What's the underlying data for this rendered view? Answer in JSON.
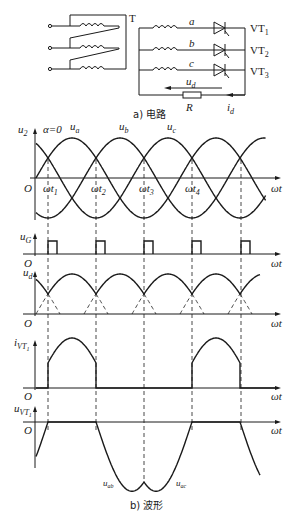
{
  "circuit": {
    "transformer_label": "T",
    "phases": [
      "a",
      "b",
      "c"
    ],
    "thyristors": [
      {
        "name": "VT",
        "sub": "1"
      },
      {
        "name": "VT",
        "sub": "2"
      },
      {
        "name": "VT",
        "sub": "3"
      }
    ],
    "output_voltage": {
      "sym": "u",
      "sub": "d"
    },
    "load": "R",
    "output_current": {
      "sym": "i",
      "sub": "d"
    },
    "caption": "a) 电路"
  },
  "waveforms": {
    "caption": "b) 波形",
    "x_axis_label": "ωt",
    "origin_label": "O",
    "alpha_label": "α=0",
    "panels": {
      "u2": {
        "sym": "u",
        "sub": "2",
        "curves": [
          {
            "sym": "u",
            "sub": "a"
          },
          {
            "sym": "u",
            "sub": "b"
          },
          {
            "sym": "u",
            "sub": "c"
          }
        ]
      },
      "uG": {
        "sym": "u",
        "sub": "G"
      },
      "ud": {
        "sym": "u",
        "sub": "d"
      },
      "iVT1": {
        "sym": "i",
        "sub": "VT",
        "subsub": "1"
      },
      "uVT1": {
        "sym": "u",
        "sub": "VT",
        "subsub": "1",
        "curve_labels": [
          {
            "sym": "u",
            "sub": "ab"
          },
          {
            "sym": "u",
            "sub": "ac"
          }
        ]
      }
    },
    "time_marks": [
      {
        "sym": "ωt",
        "sub": "1"
      },
      {
        "sym": "ωt",
        "sub": "2"
      },
      {
        "sym": "ωt",
        "sub": "3"
      },
      {
        "sym": "ωt",
        "sub": "4"
      }
    ]
  },
  "chart_data": {
    "type": "line",
    "xlabel": "ωt",
    "x_units": "degrees",
    "x_range": [
      0,
      570
    ],
    "natural_commutation_points_deg": [
      30,
      150,
      270,
      390,
      510
    ],
    "series": [
      {
        "name": "u_a",
        "formula": "sin(ωt)"
      },
      {
        "name": "u_b",
        "formula": "sin(ωt-120°)"
      },
      {
        "name": "u_c",
        "formula": "sin(ωt+120°)"
      },
      {
        "name": "u_G",
        "description": "gate pulses at 30°,150°,270°,390°,510°"
      },
      {
        "name": "u_d",
        "description": "max(u_a,u_b,u_c) envelope"
      },
      {
        "name": "i_VT1",
        "description": "conducts 30°–150°, 390°–510°"
      },
      {
        "name": "u_VT1",
        "description": "0 when conducting; u_ab then u_ac otherwise"
      }
    ]
  }
}
